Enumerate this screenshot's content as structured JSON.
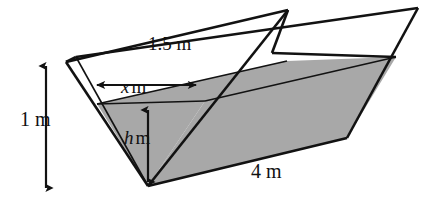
{
  "figure": {
    "shading_color": "#a8a8a8",
    "line_color": "#121212",
    "background_color": "#ffffff"
  },
  "labels": {
    "top_width": {
      "text": "1.5 m",
      "value": "1.5",
      "unit": "m",
      "meaning": "width across the open top of the trough"
    },
    "depth": {
      "text": "1 m",
      "value": "1",
      "unit": "m",
      "meaning": "full vertical depth of the trough"
    },
    "water_width": {
      "symbol": "x",
      "unit": "m",
      "text": "x m",
      "meaning": "width of the water surface"
    },
    "water_depth": {
      "symbol": "h",
      "unit": "m",
      "text": "h m",
      "meaning": "depth of the water"
    },
    "length": {
      "text": "4 m",
      "value": "4",
      "unit": "m",
      "meaning": "length of the trough"
    }
  },
  "arrows": {
    "depth_arrow": "double-headed vertical arrow",
    "water_width_arrow": "double-headed horizontal arrow",
    "water_depth_arrow": "double-headed vertical arrow"
  }
}
